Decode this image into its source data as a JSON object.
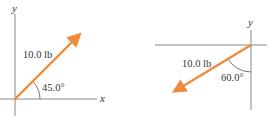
{
  "colors": {
    "vector": "#F08A3C",
    "axis": "#8a8a8a",
    "text": "#333333",
    "background": "#ffffff"
  },
  "diagrams": [
    {
      "id": "left",
      "axes": {
        "x_label": "x",
        "y_label": "y"
      },
      "vector": {
        "magnitude_label": "10.0 lb",
        "angle_label": "45.0°",
        "direction": "up-right"
      }
    },
    {
      "id": "right",
      "axes": {
        "y_label": "y"
      },
      "vector": {
        "magnitude_label": "10.0 lb",
        "angle_label": "60.0°",
        "direction": "down-left"
      }
    }
  ]
}
